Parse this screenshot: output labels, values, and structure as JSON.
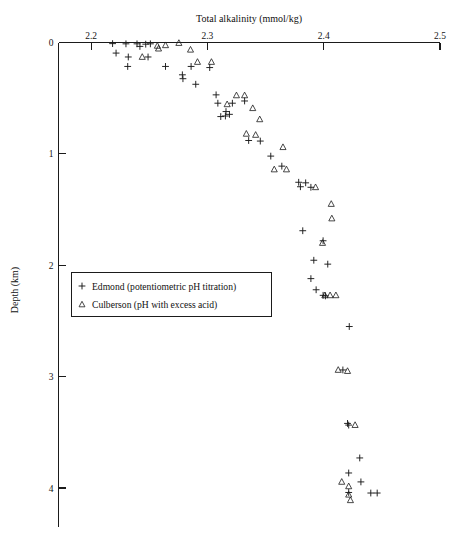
{
  "chart_data": {
    "type": "scatter",
    "title": "Total alkalinity (mmol/kg)",
    "xlabel": "Total alkalinity (mmol/kg)",
    "ylabel": "Depth (km)",
    "xlim": [
      2.172,
      2.5
    ],
    "ylim": [
      0,
      4.35
    ],
    "y_inverted": true,
    "grid": false,
    "x_axis_position": "top",
    "y_axis_position": "left",
    "xticks": [
      "2.2",
      "2.3",
      "2.4",
      "2.5"
    ],
    "xtick_values": [
      2.2,
      2.3,
      2.4,
      2.5
    ],
    "yticks": [
      "0",
      "1",
      "2",
      "3",
      "4"
    ],
    "ytick_values": [
      0,
      1,
      2,
      3,
      4
    ],
    "legend_position": "center-left",
    "series": [
      {
        "name": "Edmond  (potentiometric pH titration)",
        "marker": "plus",
        "color": "#1a1a1a",
        "points": [
          [
            2.2185,
            0.01
          ],
          [
            2.23,
            0.012
          ],
          [
            2.2395,
            0.012
          ],
          [
            2.242,
            0.035
          ],
          [
            2.247,
            0.015
          ],
          [
            2.251,
            0.012
          ],
          [
            2.2215,
            0.095
          ],
          [
            2.232,
            0.13
          ],
          [
            2.249,
            0.13
          ],
          [
            2.2315,
            0.215
          ],
          [
            2.264,
            0.215
          ],
          [
            2.286,
            0.215
          ],
          [
            2.302,
            0.225
          ],
          [
            2.2785,
            0.29
          ],
          [
            2.279,
            0.325
          ],
          [
            2.29,
            0.375
          ],
          [
            2.3075,
            0.47
          ],
          [
            2.3215,
            0.545
          ],
          [
            2.316,
            0.62
          ],
          [
            2.319,
            0.645
          ],
          [
            2.3115,
            0.665
          ],
          [
            2.3155,
            0.66
          ],
          [
            2.332,
            0.525
          ],
          [
            2.309,
            0.545
          ],
          [
            2.3355,
            0.88
          ],
          [
            2.3455,
            0.885
          ],
          [
            2.3545,
            1.02
          ],
          [
            2.364,
            1.11
          ],
          [
            2.3785,
            1.255
          ],
          [
            2.3845,
            1.26
          ],
          [
            2.38,
            1.295
          ],
          [
            2.389,
            1.3
          ],
          [
            2.382,
            1.69
          ],
          [
            2.3995,
            1.78
          ],
          [
            2.3915,
            1.955
          ],
          [
            2.4035,
            1.99
          ],
          [
            2.389,
            2.12
          ],
          [
            2.3935,
            2.22
          ],
          [
            2.3995,
            2.27
          ],
          [
            2.4015,
            2.275
          ],
          [
            2.422,
            2.55
          ],
          [
            2.4165,
            2.94
          ],
          [
            2.4205,
            3.42
          ],
          [
            2.4215,
            3.435
          ],
          [
            2.431,
            3.73
          ],
          [
            2.4215,
            3.865
          ],
          [
            2.432,
            3.945
          ],
          [
            2.4215,
            4.04
          ],
          [
            2.4405,
            4.045
          ],
          [
            2.446,
            4.045
          ]
        ]
      },
      {
        "name": "Culberson (pH with excess acid)",
        "marker": "triangle",
        "color": "#1a1a1a",
        "points": [
          [
            2.257,
            0.03
          ],
          [
            2.258,
            0.055
          ],
          [
            2.264,
            0.025
          ],
          [
            2.2755,
            0.005
          ],
          [
            2.2855,
            0.065
          ],
          [
            2.244,
            0.13
          ],
          [
            2.2915,
            0.175
          ],
          [
            2.3035,
            0.175
          ],
          [
            2.325,
            0.475
          ],
          [
            2.332,
            0.475
          ],
          [
            2.317,
            0.555
          ],
          [
            2.339,
            0.59
          ],
          [
            2.345,
            0.69
          ],
          [
            2.3335,
            0.82
          ],
          [
            2.3415,
            0.83
          ],
          [
            2.365,
            0.94
          ],
          [
            2.3575,
            1.14
          ],
          [
            2.368,
            1.14
          ],
          [
            2.393,
            1.3
          ],
          [
            2.4065,
            1.45
          ],
          [
            2.407,
            1.58
          ],
          [
            2.399,
            1.8
          ],
          [
            2.401,
            2.27
          ],
          [
            2.4055,
            2.27
          ],
          [
            2.4105,
            2.27
          ],
          [
            2.4125,
            2.94
          ],
          [
            2.4205,
            2.95
          ],
          [
            2.427,
            3.435
          ],
          [
            2.4155,
            3.945
          ],
          [
            2.4215,
            3.985
          ],
          [
            2.4215,
            4.06
          ],
          [
            2.423,
            4.11
          ]
        ]
      }
    ]
  },
  "legend": {
    "entries": [
      {
        "symbol": "+",
        "label": "Edmond  (potentiometric pH titration)"
      },
      {
        "symbol": "△",
        "label": "Culberson (pH with excess acid)"
      }
    ]
  },
  "axes": {
    "x_title": "Total alkalinity (mmol/kg)",
    "y_title": "Depth  (km)"
  }
}
